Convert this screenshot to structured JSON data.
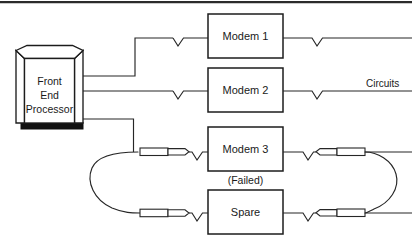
{
  "figure": {
    "top_rule": true
  },
  "devices": {
    "front_end_processor": {
      "name": "front-end-processor",
      "line1": "Front",
      "line2": "End",
      "line3": "Processor"
    },
    "modem1": {
      "label": "Modem 1"
    },
    "modem2": {
      "label": "Modem 2"
    },
    "modem3": {
      "label": "Modem 3",
      "status": "(Failed)"
    },
    "spare": {
      "label": "Spare"
    }
  },
  "labels": {
    "circuits": "Circuits"
  },
  "icons": {
    "connector": "v-connector-icon",
    "patch_plug": "patch-plug-icon",
    "patch_cord": "patch-cord-icon"
  },
  "colors": {
    "line": "#262626",
    "box_stroke": "#1c1c1c",
    "box_fill": "#ffffff",
    "text": "#1a1a1a",
    "base_shadow": "#111111",
    "background": "#ffffff"
  },
  "geometry": {
    "width": 412,
    "height": 238,
    "fep": {
      "x": 16,
      "y": 50,
      "w": 67,
      "h": 78
    },
    "boxes": {
      "modem1": {
        "x": 208,
        "y": 14,
        "w": 75,
        "h": 44
      },
      "modem2": {
        "x": 208,
        "y": 68,
        "w": 75,
        "h": 44
      },
      "modem3": {
        "x": 208,
        "y": 127,
        "w": 75,
        "h": 44
      },
      "spare": {
        "x": 208,
        "y": 190,
        "w": 75,
        "h": 44
      }
    },
    "rows_y": {
      "modem1": 38,
      "modem2": 91,
      "modem3": 152,
      "spare": 213
    }
  }
}
